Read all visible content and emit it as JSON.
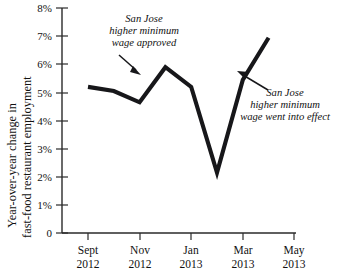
{
  "chart_data": {
    "type": "line",
    "title": "",
    "xlabel": "",
    "ylabel": "Year-over-year change in fast-food restaurant employment",
    "ylabel_line1": "Year-over-year change in",
    "ylabel_line2": "fast-food restaurant employment",
    "ylim": [
      0,
      8
    ],
    "y_unit": "%",
    "grid": false,
    "legend": "none",
    "y_ticks": [
      "0",
      "1%",
      "2%",
      "3%",
      "4%",
      "5%",
      "6%",
      "7%",
      "8%"
    ],
    "y_tick_values": [
      0,
      1,
      2,
      3,
      4,
      5,
      6,
      7,
      8
    ],
    "x_ticks": [
      {
        "month": "Sept",
        "year": "2012"
      },
      {
        "month": "Nov",
        "year": "2012"
      },
      {
        "month": "Jan",
        "year": "2013"
      },
      {
        "month": "Mar",
        "year": "2013"
      },
      {
        "month": "May",
        "year": "2013"
      }
    ],
    "x": [
      "Sept 2012",
      "Oct 2012",
      "Nov 2012",
      "Dec 2012",
      "Jan 2013",
      "Feb 2013",
      "Mar 2013",
      "Apr 2013"
    ],
    "values": [
      5.2,
      5.05,
      4.65,
      5.9,
      5.2,
      2.15,
      5.45,
      6.95
    ],
    "series": [
      {
        "name": "Year-over-year change in fast-food restaurant employment",
        "color": "#17171a",
        "values": [
          5.2,
          5.05,
          4.65,
          5.9,
          5.2,
          2.15,
          5.45,
          6.95
        ]
      }
    ],
    "annotations": [
      {
        "id": "wage-approved",
        "lines": [
          "San Jose",
          "higher minimum",
          "wage approved"
        ],
        "points_to": {
          "x": "Nov 2012",
          "y": 5.4
        }
      },
      {
        "id": "wage-into-effect",
        "lines": [
          "San Jose",
          "higher minimum",
          "wage went into effect"
        ],
        "points_to": {
          "x": "Mar 2013",
          "y": 5.7
        }
      }
    ]
  }
}
